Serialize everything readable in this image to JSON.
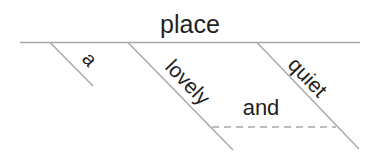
{
  "diagram": {
    "type": "sentence-diagram",
    "base_word": "place",
    "modifiers": [
      {
        "label": "a"
      },
      {
        "label": "lovely"
      },
      {
        "label": "quiet"
      }
    ],
    "conjunction": "and",
    "colors": {
      "line": "#a8a8a8",
      "text": "#1f1f1f",
      "background": "#ffffff"
    }
  }
}
